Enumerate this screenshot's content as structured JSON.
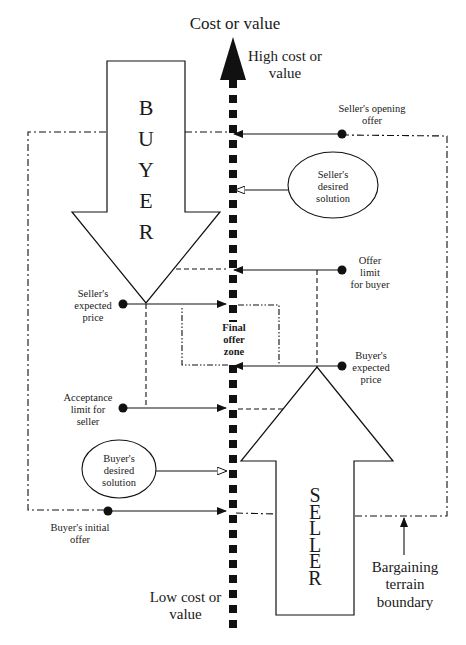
{
  "title": "Cost or value",
  "axis": {
    "top_label": "High cost or value",
    "top_label_line1": "High cost or",
    "top_label_line2": "value",
    "bottom_label_line1": "Low cost or",
    "bottom_label_line2": "value"
  },
  "parties": {
    "buyer": [
      "B",
      "U",
      "Y",
      "E",
      "R"
    ],
    "seller": [
      "S",
      "E",
      "L",
      "L",
      "E",
      "R"
    ]
  },
  "labels": {
    "sellers_opening_offer": [
      "Seller's opening",
      "offer"
    ],
    "sellers_desired_solution": [
      "Seller's",
      "desired",
      "solution"
    ],
    "offer_limit_for_buyer": [
      "Offer",
      "limit",
      "for buyer"
    ],
    "sellers_expected_price": [
      "Seller's",
      "expected",
      "price"
    ],
    "final_offer_zone": [
      "Final",
      "offer",
      "zone"
    ],
    "buyers_expected_price": [
      "Buyer's",
      "expected",
      "price"
    ],
    "acceptance_limit_for_seller": [
      "Acceptance",
      "limit for",
      "seller"
    ],
    "buyers_desired_solution": [
      "Buyer's",
      "desired",
      "solution"
    ],
    "buyers_initial_offer": [
      "Buyer's initial",
      "offer"
    ],
    "bargaining_terrain_boundary": [
      "Bargaining",
      "terrain",
      "boundary"
    ]
  },
  "colors": {
    "ink": "#111111",
    "background": "#ffffff"
  }
}
